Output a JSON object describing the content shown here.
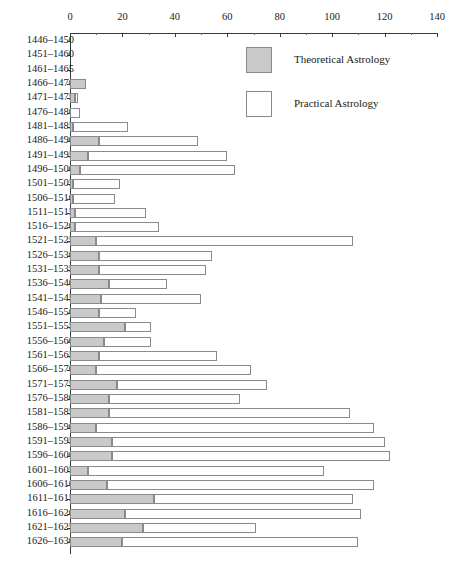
{
  "chart_data": {
    "type": "bar",
    "orientation": "horizontal",
    "stacked": true,
    "title": "",
    "subtitle": "",
    "xlabel": "",
    "ylabel": "",
    "xlim": [
      0,
      140
    ],
    "ylim": null,
    "grid": false,
    "legend_position": "top-right",
    "xticks": [
      0,
      20,
      40,
      60,
      80,
      100,
      120,
      140
    ],
    "xtick_labels": [
      "0",
      "20",
      "40",
      "60",
      "80",
      "100",
      "120",
      "140"
    ],
    "xminor_ticks": [
      10,
      30,
      50,
      70,
      90,
      110,
      130
    ],
    "categories": [
      "1446–1450",
      "1451–1460",
      "1461–1465",
      "1466–1470",
      "1471–1475",
      "1476–1480",
      "1481–1485",
      "1486–1490",
      "1491–1495",
      "1496–1500",
      "1501–1505",
      "1506–1510",
      "1511–1515",
      "1516–1520",
      "1521–1525",
      "1526–1530",
      "1531–1535",
      "1536–1540",
      "1541–1545",
      "1546–1550",
      "1551–1555",
      "1556–1560",
      "1561–1565",
      "1566–1570",
      "1571–1575",
      "1576–1580",
      "1581–1585",
      "1586–1590",
      "1591–1595",
      "1596–1600",
      "1601–1605",
      "1606–1610",
      "1611–1615",
      "1616–1620",
      "1621–1625",
      "1626–1630"
    ],
    "series": [
      {
        "name": "Theoretical Astrology",
        "color": "#c9c9c9",
        "values": [
          0,
          0,
          0,
          6,
          2,
          0,
          1,
          11,
          7,
          4,
          1,
          1,
          2,
          2,
          10,
          11,
          11,
          15,
          12,
          11,
          21,
          13,
          11,
          10,
          18,
          15,
          15,
          10,
          16,
          16,
          7,
          14,
          32,
          21,
          28,
          20
        ]
      },
      {
        "name": "Practical Astrology",
        "color": "#ffffff",
        "values": [
          0,
          0,
          0,
          0,
          1,
          4,
          21,
          38,
          53,
          59,
          18,
          16,
          27,
          32,
          98,
          43,
          41,
          22,
          38,
          14,
          10,
          18,
          45,
          59,
          57,
          50,
          92,
          106,
          104,
          106,
          90,
          102,
          76,
          90,
          43,
          90
        ]
      }
    ],
    "totals": [
      0,
      0,
      0,
      6,
      3,
      4,
      22,
      49,
      60,
      63,
      19,
      17,
      29,
      34,
      108,
      54,
      52,
      37,
      50,
      25,
      31,
      31,
      56,
      69,
      75,
      65,
      107,
      116,
      120,
      122,
      97,
      116,
      108,
      111,
      71,
      110
    ]
  },
  "legend": {
    "items": [
      {
        "label": "Theoretical Astrology",
        "swatch": "theoretical"
      },
      {
        "label": "Practical Astrology",
        "swatch": "practical"
      }
    ]
  }
}
